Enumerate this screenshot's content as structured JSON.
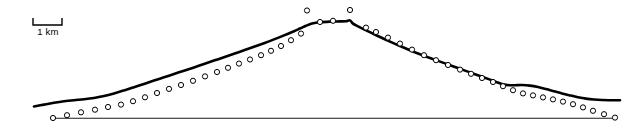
{
  "figure": {
    "type": "profile-plot",
    "width": 636,
    "height": 128,
    "background_color": "#ffffff",
    "scalebar": {
      "label": "1 km",
      "x_start": 33,
      "x_end": 62,
      "y_bar": 25,
      "tick_height": 7,
      "color": "#000000"
    }
  },
  "chart_data": {
    "type": "line",
    "title": "",
    "subtitle": "",
    "xlabel": "",
    "ylabel": "",
    "grid": false,
    "legend": null,
    "axis_ranges": {
      "x_pixels": [
        0,
        636
      ],
      "y_pixels": [
        0,
        128
      ]
    },
    "annotations": [
      {
        "name": "scale-bar",
        "text": "1 km",
        "x": 47,
        "y": 32
      }
    ],
    "series": [
      {
        "name": "smoothed-profile",
        "style": "thick-solid-line",
        "color": "#000000",
        "stroke_width": 2.6,
        "points": [
          [
            34,
            106.5
          ],
          [
            44,
            104.6
          ],
          [
            54,
            102.8
          ],
          [
            64,
            101.3
          ],
          [
            74,
            100.2
          ],
          [
            84,
            99.3
          ],
          [
            94,
            98.0
          ],
          [
            104,
            96.0
          ],
          [
            114,
            93.4
          ],
          [
            124,
            90.4
          ],
          [
            134,
            87.2
          ],
          [
            144,
            83.9
          ],
          [
            154,
            80.6
          ],
          [
            164,
            77.3
          ],
          [
            174,
            74.0
          ],
          [
            184,
            70.7
          ],
          [
            194,
            67.4
          ],
          [
            204,
            64.0
          ],
          [
            214,
            60.6
          ],
          [
            224,
            57.2
          ],
          [
            234,
            53.8
          ],
          [
            244,
            50.3
          ],
          [
            254,
            46.8
          ],
          [
            264,
            43.2
          ],
          [
            274,
            39.4
          ],
          [
            284,
            35.4
          ],
          [
            294,
            31.2
          ],
          [
            300,
            28.5
          ],
          [
            306,
            25.8
          ],
          [
            312,
            23.6
          ],
          [
            320,
            22.2
          ],
          [
            330,
            21.6
          ],
          [
            340,
            21.4
          ],
          [
            346,
            21.2
          ],
          [
            350,
            20.4
          ],
          [
            353,
            23.6
          ],
          [
            358,
            26.4
          ],
          [
            364,
            29.4
          ],
          [
            372,
            33.2
          ],
          [
            380,
            37.0
          ],
          [
            390,
            41.6
          ],
          [
            400,
            46.0
          ],
          [
            410,
            50.2
          ],
          [
            420,
            54.2
          ],
          [
            430,
            58.0
          ],
          [
            440,
            61.6
          ],
          [
            450,
            65.2
          ],
          [
            460,
            68.8
          ],
          [
            470,
            72.4
          ],
          [
            480,
            76.0
          ],
          [
            490,
            79.6
          ],
          [
            497,
            82.2
          ],
          [
            503,
            84.2
          ],
          [
            509,
            85.2
          ],
          [
            515,
            85.2
          ],
          [
            522,
            85.0
          ],
          [
            530,
            85.6
          ],
          [
            538,
            87.0
          ],
          [
            546,
            89.0
          ],
          [
            554,
            91.2
          ],
          [
            562,
            93.4
          ],
          [
            570,
            95.4
          ],
          [
            578,
            97.2
          ],
          [
            586,
            98.6
          ],
          [
            594,
            99.5
          ],
          [
            602,
            100.0
          ],
          [
            610,
            100.2
          ],
          [
            620,
            100.3
          ]
        ]
      },
      {
        "name": "measured-data-points",
        "style": "open-circle-markers",
        "marker_radius": 2.6,
        "marker_fill": "#ffffff",
        "marker_stroke": "#000000",
        "marker_stroke_width": 1.0,
        "points": [
          [
            53,
            118.0
          ],
          [
            67,
            115.2
          ],
          [
            81,
            112.3
          ],
          [
            95,
            109.7
          ],
          [
            108,
            107.0
          ],
          [
            121,
            104.6
          ],
          [
            133,
            101.2
          ],
          [
            145,
            97.3
          ],
          [
            157,
            93.0
          ],
          [
            169,
            88.9
          ],
          [
            181,
            85.0
          ],
          [
            193,
            80.8
          ],
          [
            205,
            76.4
          ],
          [
            217,
            72.0
          ],
          [
            228,
            67.8
          ],
          [
            239,
            63.6
          ],
          [
            250,
            59.5
          ],
          [
            261,
            55.2
          ],
          [
            271,
            50.8
          ],
          [
            281,
            46.0
          ],
          [
            291,
            40.2
          ],
          [
            301,
            33.6
          ],
          [
            307,
            10.5
          ],
          [
            320,
            22.0
          ],
          [
            333,
            20.8
          ],
          [
            350,
            10.0
          ],
          [
            366,
            27.6
          ],
          [
            376,
            32.0
          ],
          [
            388,
            37.6
          ],
          [
            400,
            43.6
          ],
          [
            412,
            49.6
          ],
          [
            424,
            55.2
          ],
          [
            436,
            60.2
          ],
          [
            448,
            65.0
          ],
          [
            460,
            69.6
          ],
          [
            471,
            73.8
          ],
          [
            482,
            78.0
          ],
          [
            493,
            82.0
          ],
          [
            503,
            86.2
          ],
          [
            513,
            90.2
          ],
          [
            523,
            93.4
          ],
          [
            533,
            95.4
          ],
          [
            543,
            97.4
          ],
          [
            553,
            99.4
          ],
          [
            563,
            101.6
          ],
          [
            573,
            104.2
          ],
          [
            583,
            107.4
          ],
          [
            593,
            110.8
          ],
          [
            604,
            114.2
          ],
          [
            615,
            117.6
          ]
        ]
      },
      {
        "name": "baseline",
        "style": "thin-solid-line",
        "color": "#1a1a1a",
        "stroke_width": 1.1,
        "points": [
          [
            53,
            118.2
          ],
          [
            616,
            118.2
          ]
        ]
      }
    ]
  }
}
